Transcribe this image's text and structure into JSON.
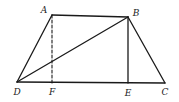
{
  "figure": {
    "type": "geometry",
    "shape": "trapezoid",
    "points": [
      {
        "id": "A",
        "label": "A"
      },
      {
        "id": "B",
        "label": "B"
      },
      {
        "id": "C",
        "label": "C"
      },
      {
        "id": "D",
        "label": "D"
      },
      {
        "id": "E",
        "label": "E"
      },
      {
        "id": "F",
        "label": "F"
      }
    ],
    "segments": [
      {
        "id": "AB",
        "from": "A",
        "to": "B",
        "style": "solid"
      },
      {
        "id": "AD",
        "from": "A",
        "to": "D",
        "style": "solid"
      },
      {
        "id": "BC",
        "from": "B",
        "to": "C",
        "style": "solid"
      },
      {
        "id": "DC",
        "from": "D",
        "to": "C",
        "style": "solid"
      },
      {
        "id": "BD",
        "from": "B",
        "to": "D",
        "style": "solid"
      },
      {
        "id": "BE",
        "from": "B",
        "to": "E",
        "style": "solid"
      },
      {
        "id": "AF",
        "from": "A",
        "to": "F",
        "style": "dashed"
      }
    ]
  }
}
